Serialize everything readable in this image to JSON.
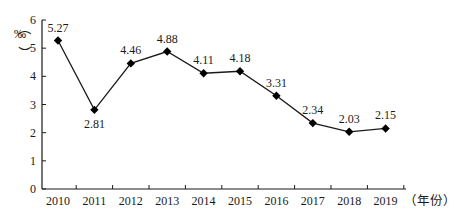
{
  "chart_data": {
    "type": "line",
    "title": "",
    "xlabel": "（年份）",
    "ylabel": "‰",
    "categories": [
      "2010",
      "2011",
      "2012",
      "2013",
      "2014",
      "2015",
      "2016",
      "2017",
      "2018",
      "2019"
    ],
    "values": [
      5.27,
      2.81,
      4.46,
      4.88,
      4.11,
      4.18,
      3.31,
      2.34,
      2.03,
      2.15
    ],
    "data_labels": [
      "5.27",
      "2.81",
      "4.46",
      "4.88",
      "4.11",
      "4.18",
      "3.31",
      "2.34",
      "2.03",
      "2.15"
    ],
    "ylim": [
      0,
      6
    ],
    "yticks": [
      "0",
      "1",
      "2",
      "3",
      "4",
      "5",
      "6"
    ],
    "grid": false,
    "legend": null,
    "marker": "diamond",
    "colors": {
      "line": "#1a1a1a",
      "marker": "#000000",
      "axis": "#1a1a1a"
    }
  },
  "axis": {
    "y_unit_top": "（",
    "y_unit": "‰",
    "y_unit_bottom": "）",
    "x_unit": "（年份）"
  }
}
